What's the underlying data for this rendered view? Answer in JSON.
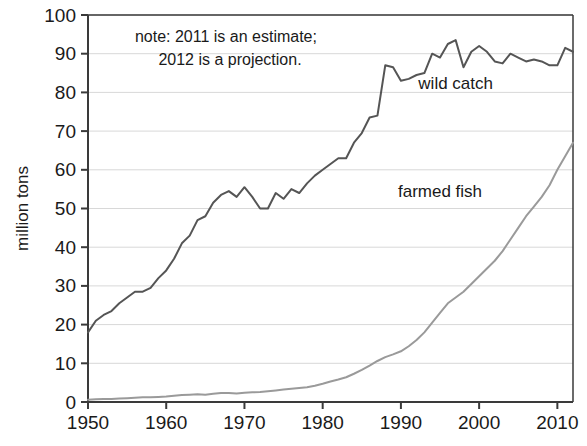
{
  "chart_data": {
    "type": "line",
    "title": "",
    "subtitle": "",
    "xlabel": "",
    "ylabel": "million tons",
    "xlim": [
      1950,
      2012
    ],
    "ylim": [
      0,
      100
    ],
    "grid": true,
    "legend_position": "inline-annotation",
    "y_ticks": [
      0,
      10,
      20,
      30,
      40,
      50,
      60,
      70,
      80,
      90,
      100
    ],
    "y_tick_labels": [
      "0",
      "10",
      "20",
      "30",
      "40",
      "50",
      "60",
      "70",
      "80",
      "90",
      "100"
    ],
    "x_ticks": [
      1950,
      1960,
      1970,
      1980,
      1990,
      2000,
      2010
    ],
    "x_tick_labels": [
      "1950",
      "1960",
      "1970",
      "1980",
      "1990",
      "2000",
      "2010"
    ],
    "annotations": [
      {
        "name": "note-line-1",
        "text": "note: 2011 is an estimate;",
        "x": 1956,
        "y": 93
      },
      {
        "name": "note-line-2",
        "text": "2012 is a projection.",
        "x": 1959,
        "y": 87
      }
    ],
    "x": [
      1950,
      1951,
      1952,
      1953,
      1954,
      1955,
      1956,
      1957,
      1958,
      1959,
      1960,
      1961,
      1962,
      1963,
      1964,
      1965,
      1966,
      1967,
      1968,
      1969,
      1970,
      1971,
      1972,
      1973,
      1974,
      1975,
      1976,
      1977,
      1978,
      1979,
      1980,
      1981,
      1982,
      1983,
      1984,
      1985,
      1986,
      1987,
      1988,
      1989,
      1990,
      1991,
      1992,
      1993,
      1994,
      1995,
      1996,
      1997,
      1998,
      1999,
      2000,
      2001,
      2002,
      2003,
      2004,
      2005,
      2006,
      2007,
      2008,
      2009,
      2010,
      2011,
      2012
    ],
    "series": [
      {
        "name": "wild catch",
        "label": "wild catch",
        "color": "#555555",
        "label_x": 1997,
        "label_y": 81,
        "values": [
          18.0,
          21.0,
          22.5,
          23.5,
          25.5,
          27.0,
          28.5,
          28.5,
          29.5,
          32.0,
          34.0,
          37.0,
          41.0,
          43.0,
          47.0,
          48.0,
          51.5,
          53.5,
          54.5,
          53.0,
          55.5,
          53.0,
          50.0,
          50.0,
          54.0,
          52.5,
          55.0,
          54.0,
          56.5,
          58.5,
          60.0,
          61.5,
          63.0,
          63.0,
          67.0,
          69.5,
          73.5,
          74.0,
          87.0,
          86.5,
          83.0,
          83.5,
          84.5,
          85.0,
          90.0,
          89.0,
          92.5,
          93.5,
          86.5,
          90.5,
          92.0,
          90.5,
          88.0,
          87.5,
          90.0,
          89.0,
          88.0,
          88.5,
          88.0,
          87.0,
          87.0,
          91.5,
          90.5
        ]
      },
      {
        "name": "farmed fish",
        "label": "farmed fish",
        "color": "#9a9a9a",
        "label_x": 1995,
        "label_y": 53,
        "values": [
          0.6,
          0.7,
          0.8,
          0.8,
          0.9,
          1.0,
          1.1,
          1.2,
          1.2,
          1.3,
          1.4,
          1.6,
          1.8,
          1.9,
          2.0,
          1.9,
          2.1,
          2.3,
          2.3,
          2.2,
          2.4,
          2.5,
          2.6,
          2.8,
          3.0,
          3.2,
          3.4,
          3.6,
          3.8,
          4.2,
          4.7,
          5.3,
          5.8,
          6.4,
          7.3,
          8.3,
          9.4,
          10.6,
          11.6,
          12.3,
          13.1,
          14.4,
          16.0,
          18.0,
          20.5,
          23.0,
          25.5,
          27.0,
          28.5,
          30.5,
          32.5,
          34.5,
          36.5,
          39.0,
          42.0,
          45.0,
          48.0,
          50.5,
          53.0,
          56.0,
          60.0,
          63.5,
          67.0
        ]
      }
    ]
  }
}
